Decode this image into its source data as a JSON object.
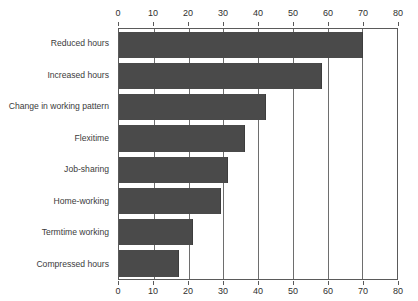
{
  "chart_data": {
    "type": "bar",
    "orientation": "horizontal",
    "title": "",
    "subtitle": "",
    "xlabel": "",
    "ylabel": "",
    "xlim": [
      0,
      80
    ],
    "xticks": [
      0,
      10,
      20,
      30,
      40,
      50,
      60,
      70,
      80
    ],
    "grid": true,
    "grid_axis": "x",
    "legend": false,
    "axis_positions": [
      "top",
      "bottom"
    ],
    "bar_color": "#4a4a4a",
    "categories": [
      "Reduced hours",
      "Increased hours",
      "Change in working pattern",
      "Flexitime",
      "Job-sharing",
      "Home-working",
      "Termtime working",
      "Compressed hours"
    ],
    "values": [
      70,
      58,
      42,
      36,
      31,
      29,
      21,
      17
    ],
    "series": [
      {
        "name": "",
        "values": [
          70,
          58,
          42,
          36,
          31,
          29,
          21,
          17
        ]
      }
    ]
  },
  "top_remnant": {
    "text": ""
  }
}
